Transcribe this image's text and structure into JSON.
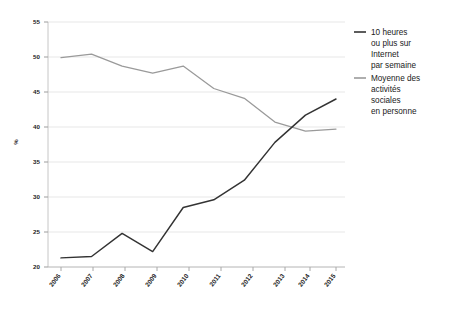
{
  "chart_data": {
    "type": "line",
    "title": "",
    "subtitle": "",
    "xlabel": "",
    "ylabel": "%",
    "x": [
      "2006",
      "2007",
      "2008",
      "2009",
      "2010",
      "2011",
      "2012",
      "2013",
      "2014",
      "2015"
    ],
    "categories": [
      "2006",
      "2007",
      "2008",
      "2009",
      "2010",
      "2011",
      "2012",
      "2013",
      "2014",
      "2015"
    ],
    "ylim": [
      20,
      55
    ],
    "yticks": [
      20,
      25,
      30,
      35,
      40,
      45,
      50,
      55
    ],
    "ytick_labels": [
      "20",
      "25",
      "30",
      "35",
      "40",
      "45",
      "50",
      "55"
    ],
    "grid": true,
    "grid_axis": "y",
    "legend_position": "right",
    "series": [
      {
        "name": "10 heures ou plus sur Internet par semaine",
        "color": "#333333",
        "values": [
          21.3,
          21.5,
          24.8,
          22.2,
          28.5,
          29.6,
          32.4,
          37.8,
          41.7,
          44.0
        ]
      },
      {
        "name": "Moyenne des activités sociales en personne",
        "color": "#9a9a9a",
        "values": [
          49.9,
          50.4,
          48.7,
          47.7,
          48.7,
          45.5,
          44.1,
          40.7,
          39.4,
          39.7
        ]
      }
    ]
  },
  "legend": {
    "items": [
      {
        "label_lines": [
          "10 heures",
          "ou plus sur",
          "Internet",
          "par semaine"
        ],
        "color": "#333333"
      },
      {
        "label_lines": [
          "Moyenne des",
          "activités",
          "sociales",
          "en personne"
        ],
        "color": "#9a9a9a"
      }
    ],
    "item_0_line_0": "10 heures",
    "item_0_line_1": "ou plus sur",
    "item_0_line_2": "Internet",
    "item_0_line_3": "par semaine",
    "item_1_line_0": "Moyenne des",
    "item_1_line_1": "activités",
    "item_1_line_2": "sociales",
    "item_1_line_3": "en personne"
  },
  "axes": {
    "y_label": "%",
    "y_tick_0": "20",
    "y_tick_1": "25",
    "y_tick_2": "30",
    "y_tick_3": "35",
    "y_tick_4": "40",
    "y_tick_5": "45",
    "y_tick_6": "50",
    "y_tick_7": "55",
    "x_tick_0": "2006",
    "x_tick_1": "2007",
    "x_tick_2": "2008",
    "x_tick_3": "2009",
    "x_tick_4": "2010",
    "x_tick_5": "2011",
    "x_tick_6": "2012",
    "x_tick_7": "2013",
    "x_tick_8": "2014",
    "x_tick_9": "2015"
  },
  "colors": {
    "series_dark": "#333333",
    "series_gray": "#9a9a9a",
    "grid": "#e2e2e2",
    "axis": "#bdbdbd",
    "text": "#1a1a1a",
    "background": "#ffffff"
  }
}
